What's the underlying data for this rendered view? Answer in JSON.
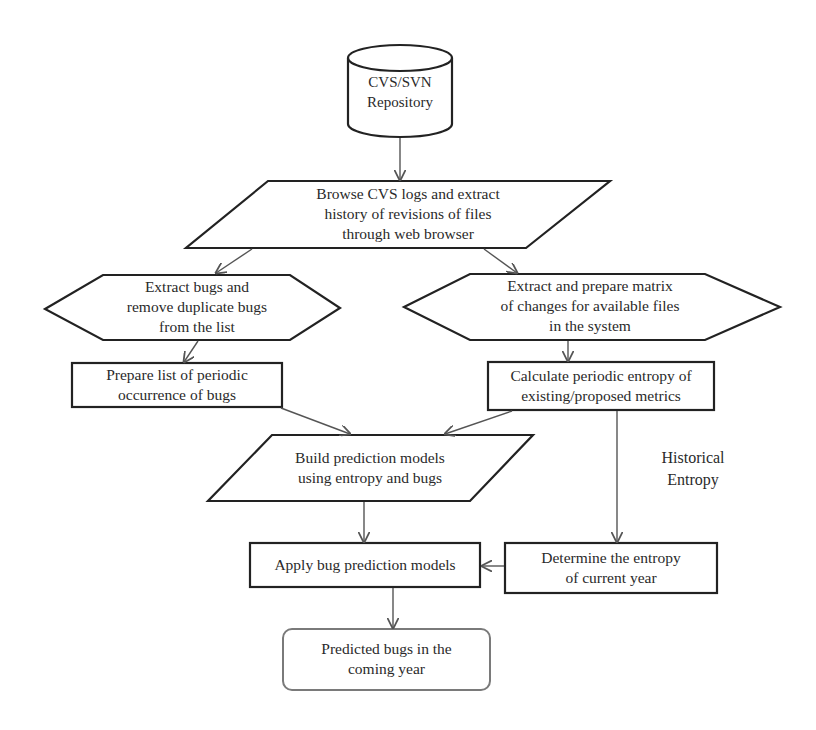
{
  "diagram": {
    "type": "flowchart",
    "nodes": {
      "repository": {
        "shape": "cylinder",
        "lines": [
          "CVS/SVN",
          "Repository"
        ]
      },
      "browse_logs": {
        "shape": "parallelogram",
        "lines": [
          "Browse CVS logs and extract",
          "history of revisions of files",
          "through web browser"
        ]
      },
      "extract_bugs": {
        "shape": "hexagon",
        "lines": [
          "Extract bugs and",
          "remove duplicate bugs",
          "from the list"
        ]
      },
      "extract_matrix": {
        "shape": "hexagon",
        "lines": [
          "Extract and prepare matrix",
          "of changes for available files",
          "in the system"
        ]
      },
      "prepare_list": {
        "shape": "rectangle",
        "lines": [
          "Prepare list of periodic",
          "occurrence of bugs"
        ]
      },
      "calculate_entropy": {
        "shape": "rectangle",
        "lines": [
          "Calculate periodic entropy of",
          "existing/proposed metrics"
        ]
      },
      "build_models": {
        "shape": "parallelogram",
        "lines": [
          "Build prediction models",
          "using entropy and bugs"
        ]
      },
      "apply_models": {
        "shape": "rectangle",
        "lines": [
          "Apply bug prediction models"
        ]
      },
      "determine_entropy": {
        "shape": "rectangle",
        "lines": [
          "Determine the entropy",
          "of current year"
        ]
      },
      "predicted_bugs": {
        "shape": "rounded-rectangle",
        "lines": [
          "Predicted bugs in the",
          "coming year"
        ]
      }
    },
    "annotations": {
      "historical_entropy": {
        "lines": [
          "Historical",
          "Entropy"
        ]
      }
    },
    "edges": [
      {
        "from": "repository",
        "to": "browse_logs"
      },
      {
        "from": "browse_logs",
        "to": "extract_bugs"
      },
      {
        "from": "browse_logs",
        "to": "extract_matrix"
      },
      {
        "from": "extract_bugs",
        "to": "prepare_list"
      },
      {
        "from": "extract_matrix",
        "to": "calculate_entropy"
      },
      {
        "from": "prepare_list",
        "to": "build_models"
      },
      {
        "from": "calculate_entropy",
        "to": "build_models"
      },
      {
        "from": "calculate_entropy",
        "to": "determine_entropy"
      },
      {
        "from": "build_models",
        "to": "apply_models"
      },
      {
        "from": "determine_entropy",
        "to": "apply_models"
      },
      {
        "from": "apply_models",
        "to": "predicted_bugs"
      }
    ],
    "colors": {
      "stroke": "#222222",
      "arrow": "#555555",
      "rounded_stroke": "#7a7a7a",
      "text": "#2a2a2a",
      "background": "#ffffff"
    }
  }
}
